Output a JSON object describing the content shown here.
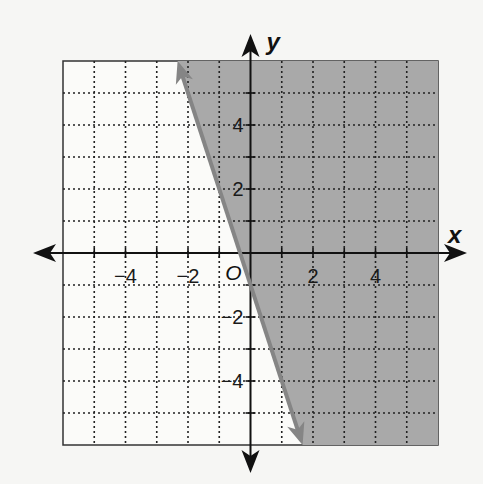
{
  "chart_data": {
    "type": "line",
    "title": "",
    "xlabel": "x",
    "ylabel": "y",
    "origin_label": "O",
    "xlim": [
      -6,
      6
    ],
    "ylim": [
      -6,
      6
    ],
    "grid": true,
    "grid_style": "dotted",
    "x_ticks": [
      {
        "value": -4,
        "label": "−4"
      },
      {
        "value": -2,
        "label": "−2"
      },
      {
        "value": 2,
        "label": "2"
      },
      {
        "value": 4,
        "label": "4"
      }
    ],
    "y_ticks": [
      {
        "value": 4,
        "label": "4"
      },
      {
        "value": 2,
        "label": "2"
      },
      {
        "value": -2,
        "label": "−2"
      },
      {
        "value": -4,
        "label": "−4"
      }
    ],
    "boundary_line": {
      "equation": "y = -3x - 1",
      "slope": -3,
      "intercept": -1,
      "style": "solid",
      "arrows": "both",
      "points": [
        [
          -2.333,
          6
        ],
        [
          1.667,
          -6
        ]
      ]
    },
    "shaded_region": "y >= -3x - 1",
    "inequality": "y ≥ −3x − 1"
  },
  "colors": {
    "background": "#f6f6f4",
    "shade": "#a9a9a9",
    "line": "#858585",
    "axis": "#111111",
    "grid": "#222222"
  }
}
